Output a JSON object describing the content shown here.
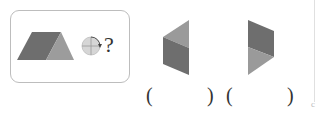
{
  "question": {
    "prompt_symbol": "?",
    "given_shape": "trapezoid-two-tone",
    "rotation_hint": "quarter-turn-clockwise",
    "colors": {
      "dark": "#6e6e6e",
      "light": "#9a9a9a",
      "border": "#bdbdbd"
    }
  },
  "options": [
    {
      "shape": "hexagon-left-pointing",
      "answer_open": "(",
      "answer_close": ")",
      "answer_value": ""
    },
    {
      "shape": "hexagon-right-pointing",
      "answer_open": "(",
      "answer_close": ")",
      "answer_value": ""
    }
  ]
}
